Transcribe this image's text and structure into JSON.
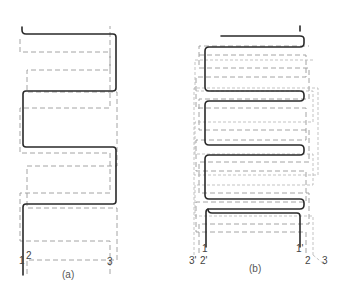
{
  "figure": {
    "panels": [
      {
        "id": "a",
        "caption": "(a)",
        "labels": {
          "l1": "1",
          "l2": "2",
          "l3": "3"
        },
        "description": "Single serpentine winding (solid, 1) with two dashed offset serpentine windings (2, 3)"
      },
      {
        "id": "b",
        "caption": "(b)",
        "labels": {
          "l1": "1",
          "l1p": "1'",
          "l2": "2",
          "l2p": "2'",
          "l3": "3",
          "l3p": "3'"
        },
        "description": "Double-layer serpentine winding (solid, 1-1') with dashed windings (2-2', 3-3')"
      }
    ],
    "colors": {
      "solid": "#2a2a2a",
      "dashed": "#9a9a9a",
      "background": "#ffffff"
    }
  }
}
